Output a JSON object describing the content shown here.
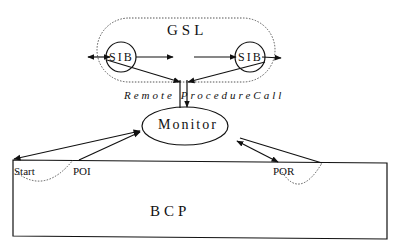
{
  "diagram": {
    "gsl_label": "GSL",
    "sib_left_label": "SIB",
    "sib_right_label": "SIB",
    "rpc_label": "RemoteProcedureCall",
    "rpc_display": "Remote ProcedureCall",
    "monitor_label": "Monitor",
    "start_label": "Start",
    "poi_label": "POI",
    "por_label": "POR",
    "bcp_label": "BCP"
  },
  "colors": {
    "stroke": "#111111",
    "background": "#ffffff"
  }
}
